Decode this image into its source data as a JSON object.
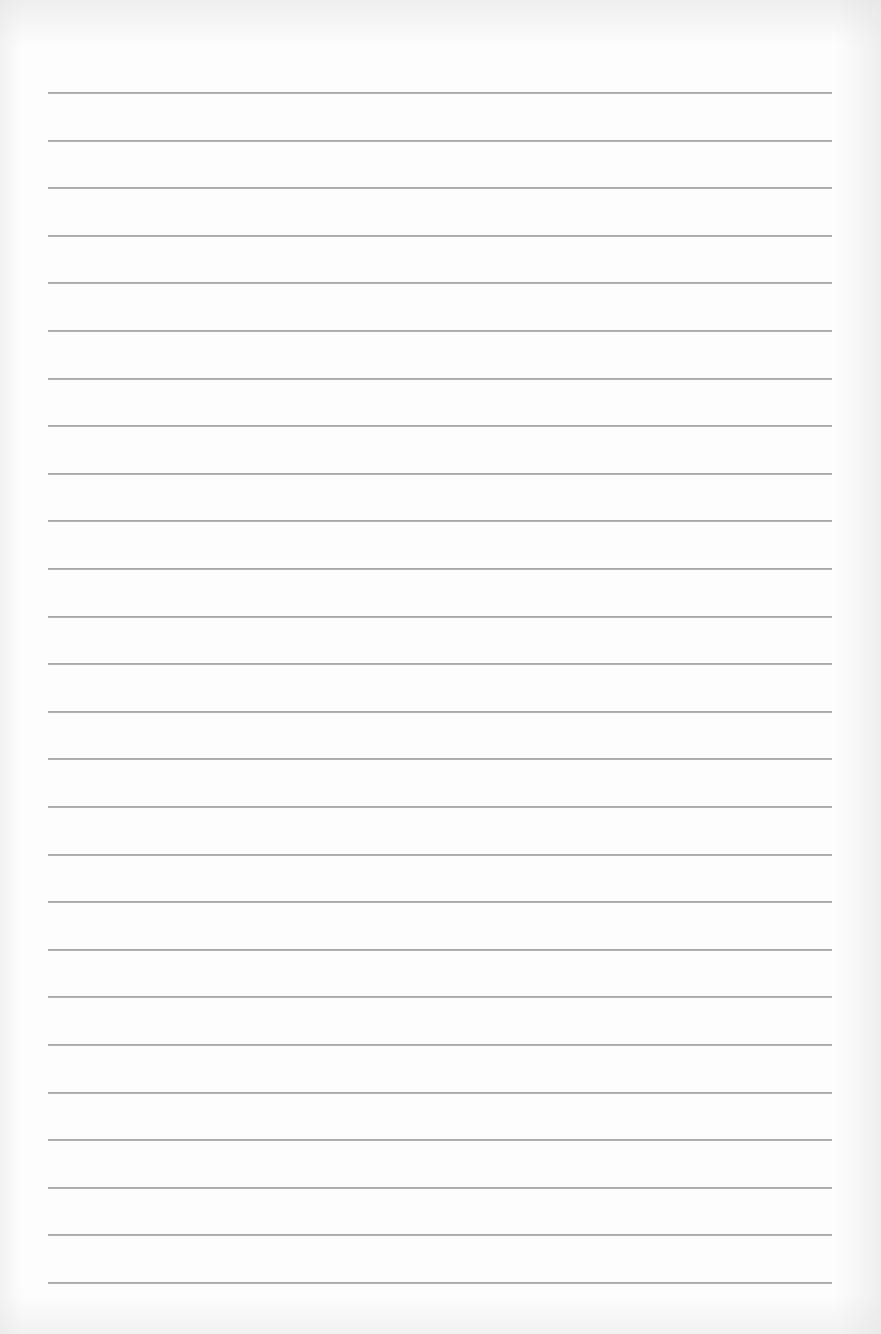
{
  "document": {
    "type": "lined-paper",
    "background_color": "#fdfdfd",
    "line_color": "#a9a9a9",
    "line_count": 26,
    "first_line_y": 92,
    "line_spacing_px": 47.6,
    "line_left_x": 48,
    "line_right_x": 832,
    "text_content": []
  }
}
